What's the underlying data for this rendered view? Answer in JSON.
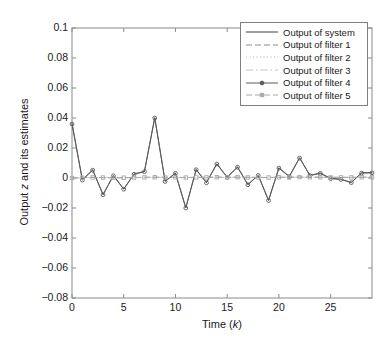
{
  "chart_data": {
    "type": "line",
    "title": "",
    "xlabel": "Time (k)",
    "ylabel": "Output z and its estimates",
    "xlim": [
      0,
      29
    ],
    "ylim": [
      -0.08,
      0.1
    ],
    "xticks": [
      0,
      5,
      10,
      15,
      20,
      25
    ],
    "yticks": [
      -0.08,
      -0.06,
      -0.04,
      -0.02,
      0,
      0.02,
      0.04,
      0.06,
      0.08,
      0.1
    ],
    "ytick_labels": [
      "-0.08",
      "-0.06",
      "-0.04",
      "-0.02",
      "0",
      "0.02",
      "0.04",
      "0.06",
      "0.08",
      "0.1"
    ],
    "xtick_labels": [
      "0",
      "5",
      "10",
      "15",
      "20",
      "25"
    ],
    "grid": false,
    "legend_position": "top-right",
    "x": [
      0,
      1,
      2,
      3,
      4,
      5,
      6,
      7,
      8,
      9,
      10,
      11,
      12,
      13,
      14,
      15,
      16,
      17,
      18,
      19,
      20,
      21,
      22,
      23,
      24,
      25,
      26,
      27,
      28,
      29
    ],
    "series": [
      {
        "name": "Output of system",
        "style": "solid",
        "marker": "none",
        "color": "#3d3d3d",
        "values": [
          0.0365,
          -0.0012,
          0.0055,
          -0.011,
          0.0017,
          -0.0073,
          0.0027,
          0.0044,
          0.0403,
          -0.0021,
          0.0033,
          -0.0198,
          0.0057,
          -0.003,
          0.0095,
          0.0006,
          0.0074,
          -0.0043,
          0.0019,
          -0.0148,
          0.0068,
          0.0011,
          0.0135,
          0.0018,
          0.0033,
          -0.0002,
          -0.0008,
          -0.0029,
          0.0035,
          0.0036
        ]
      },
      {
        "name": "Output of filter 1",
        "style": "dashed",
        "marker": "none",
        "color": "#8c8c8c",
        "values": [
          0.0,
          0.0002,
          0.0004,
          0.0003,
          0.0002,
          0.0002,
          0.0003,
          0.0004,
          0.0005,
          0.0004,
          0.0004,
          0.0003,
          0.0004,
          0.0004,
          0.0005,
          0.0004,
          0.0005,
          0.0004,
          0.0004,
          0.0003,
          0.0005,
          0.0004,
          0.0006,
          0.0005,
          0.0005,
          0.0004,
          0.0004,
          0.0004,
          0.0005,
          0.0005
        ]
      },
      {
        "name": "Output of filter 2",
        "style": "dotted",
        "marker": "none",
        "color": "#b5b5b5",
        "values": [
          0.0,
          0.0002,
          0.0004,
          0.0003,
          0.0002,
          0.0002,
          0.0003,
          0.0004,
          0.0005,
          0.0004,
          0.0004,
          0.0003,
          0.0004,
          0.0004,
          0.0005,
          0.0004,
          0.0005,
          0.0004,
          0.0004,
          0.0003,
          0.0005,
          0.0004,
          0.0006,
          0.0005,
          0.0005,
          0.0004,
          0.0004,
          0.0004,
          0.0005,
          0.0005
        ]
      },
      {
        "name": "Output of filter 3",
        "style": "dashdot",
        "marker": "none",
        "color": "#c4c4c4",
        "values": [
          0.0,
          0.0002,
          0.0004,
          0.0003,
          0.0002,
          0.0002,
          0.0003,
          0.0004,
          0.0005,
          0.0004,
          0.0004,
          0.0003,
          0.0004,
          0.0004,
          0.0005,
          0.0004,
          0.0005,
          0.0004,
          0.0004,
          0.0003,
          0.0005,
          0.0004,
          0.0006,
          0.0005,
          0.0005,
          0.0004,
          0.0004,
          0.0004,
          0.0005,
          0.0005
        ]
      },
      {
        "name": "Output of filter 4",
        "style": "solid",
        "marker": "dot",
        "color": "#5a5a5a",
        "values": [
          0.036,
          -0.0014,
          0.0052,
          -0.0112,
          0.0015,
          -0.0075,
          0.0025,
          0.0042,
          0.04,
          -0.0023,
          0.0031,
          -0.02,
          0.0055,
          -0.0032,
          0.0093,
          0.0004,
          0.0072,
          -0.0045,
          0.0017,
          -0.015,
          0.0066,
          0.0009,
          0.0133,
          0.0016,
          0.0031,
          -0.0004,
          -0.001,
          -0.0031,
          0.0033,
          0.0034
        ]
      },
      {
        "name": "Output of filter 5",
        "style": "dashed",
        "marker": "square",
        "color": "#a8a8a8",
        "values": [
          0.0,
          0.0002,
          0.0004,
          0.0003,
          0.0002,
          0.0002,
          0.0003,
          0.0004,
          0.0005,
          0.0004,
          0.0004,
          0.0003,
          0.0004,
          0.0004,
          0.0005,
          0.0004,
          0.0005,
          0.0004,
          0.0004,
          0.0003,
          0.0005,
          0.0004,
          0.0006,
          0.0005,
          0.0005,
          0.0004,
          0.0004,
          0.0004,
          0.0005,
          0.0005
        ]
      }
    ]
  },
  "axes": {
    "ylabel_prefix": "Output ",
    "ylabel_italic": "z",
    "ylabel_suffix": " and its estimates",
    "xlabel_prefix": "Time (",
    "xlabel_italic": "k",
    "xlabel_suffix": ")"
  },
  "legend": {
    "items": [
      {
        "label": "Output of system"
      },
      {
        "label": "Output of filter 1"
      },
      {
        "label": "Output of filter 2"
      },
      {
        "label": "Output of filter 3"
      },
      {
        "label": "Output of filter 4"
      },
      {
        "label": "Output of filter 5"
      }
    ]
  }
}
